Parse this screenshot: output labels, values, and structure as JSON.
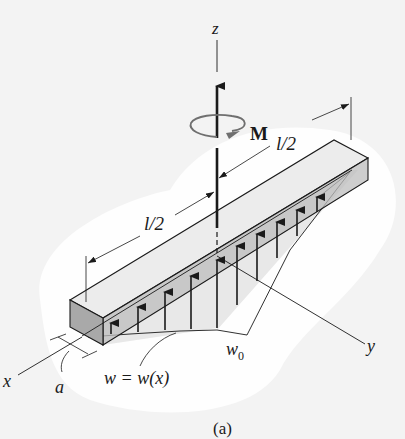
{
  "figure": {
    "caption": "(a)",
    "labels": {
      "z_axis": "z",
      "x_axis": "x",
      "y_axis": "y",
      "moment": "M",
      "half_length_top": "l/2",
      "half_length_bottom": "l/2",
      "load_peak": "w",
      "load_peak_sub": "0",
      "load_function": "w = w(x)",
      "width": "a"
    },
    "colors": {
      "background": "#f3f3f3",
      "halo": "#ffffff",
      "beam_top": "#ececec",
      "beam_front": "#bdbdbd",
      "beam_end": "#a9a9a9",
      "load_region": "#d6d6d6",
      "ink": "#1a1a1a",
      "moment_ring": "#6f6f6f"
    }
  }
}
